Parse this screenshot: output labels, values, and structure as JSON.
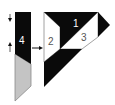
{
  "diagram": {
    "type": "paper-piecing assembly",
    "colors": {
      "dark": "#0a0a0a",
      "light": "#ffffff",
      "grey": "#c4c4c4",
      "outline": "#8a8a8a"
    },
    "strip": {
      "pieces": [
        {
          "label": "4",
          "fill": "dark"
        },
        {
          "label": "",
          "fill": "grey"
        }
      ],
      "arrows": [
        "down-arrow",
        "up-arrow"
      ]
    },
    "join_arrow": "right-arrow",
    "block": {
      "pieces": [
        {
          "label": "1",
          "fill": "dark"
        },
        {
          "label": "2",
          "fill": "light"
        },
        {
          "label": "3",
          "fill": "light"
        },
        {
          "label": "",
          "fill": "dark"
        },
        {
          "label": "",
          "fill": "dark"
        }
      ]
    }
  }
}
